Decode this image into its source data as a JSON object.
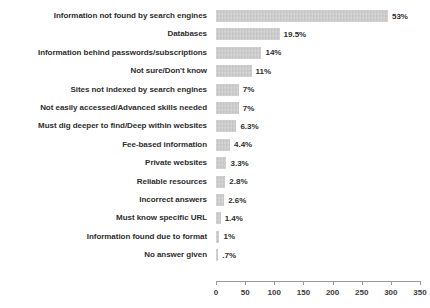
{
  "chart_data": {
    "type": "bar",
    "orientation": "horizontal",
    "title": "",
    "xlabel": "",
    "ylabel": "",
    "xlim": [
      0,
      350
    ],
    "xticks": [
      0,
      50,
      100,
      150,
      200,
      250,
      300,
      350
    ],
    "grid": false,
    "legend": null,
    "bar_color": "#c9c9c9",
    "categories": [
      "Information not found by search engines",
      "Databases",
      "Information behind passwords/subscriptions",
      "Not sure/Don't know",
      "Sites not indexed by search engines",
      "Not easily accessed/Advanced skills needed",
      "Must dig deeper to find/Deep within websites",
      "Fee-based information",
      "Private websites",
      "Reliable resources",
      "Incorrect answers",
      "Must know specific URL",
      "Information found due to format",
      "No answer given"
    ],
    "values": [
      295,
      109,
      78,
      61,
      39,
      39,
      35,
      24,
      18,
      16,
      14,
      8,
      6,
      4
    ],
    "data_labels": [
      "53%",
      "19.5%",
      "14%",
      "11%",
      "7%",
      "7%",
      "6.3%",
      "4.4%",
      "3.3%",
      "2.8%",
      "2.6%",
      "1.4%",
      "1%",
      ".7%"
    ],
    "percentages": [
      53,
      19.5,
      14,
      11,
      7,
      7,
      6.3,
      4.4,
      3.3,
      2.8,
      2.6,
      1.4,
      1,
      0.7
    ]
  }
}
